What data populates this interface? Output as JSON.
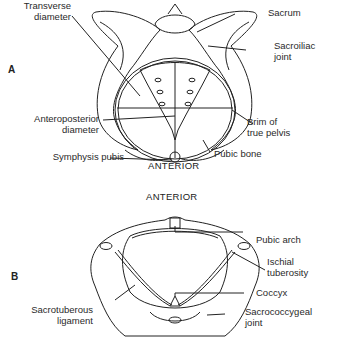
{
  "figure": {
    "panel_a": {
      "letter": "A",
      "orientation_label": "ANTERIOR",
      "labels": {
        "transverse_diameter": [
          "Transverse",
          "diameter"
        ],
        "sacrum": "Sacrum",
        "sacroiliac_joint": [
          "Sacroiliac",
          "joint"
        ],
        "anteroposterior_diameter": [
          "Anteroposterior",
          "diameter"
        ],
        "brim_of_true_pelvis": [
          "Brim of",
          "true pelvis"
        ],
        "symphysis_pubis": "Symphysis pubis",
        "pubic_bone": "Pubic bone"
      }
    },
    "panel_b": {
      "letter": "B",
      "orientation_label": "ANTERIOR",
      "labels": {
        "pubic_arch": "Pubic arch",
        "ischial_tuberosity": [
          "Ischial",
          "tuberosity"
        ],
        "coccyx": "Coccyx",
        "sacrotuberous_ligament": [
          "Sacrotuberous",
          "ligament"
        ],
        "sacrococcygeal_joint": [
          "Sacrococcygeal",
          "joint"
        ]
      }
    },
    "colors": {
      "line": "#222222",
      "background": "#ffffff"
    }
  }
}
